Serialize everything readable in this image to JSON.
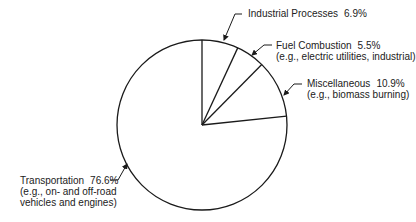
{
  "chart_data": {
    "type": "pie",
    "title": "",
    "start_angle_deg": 90,
    "direction": "clockwise",
    "slices": [
      {
        "name": "Industrial Processes",
        "sub": "",
        "value": 6.9,
        "label": "6.9%"
      },
      {
        "name": "Fuel Combustion",
        "sub": "(e.g., electric utilities, industrial)",
        "value": 5.5,
        "label": "5.5%"
      },
      {
        "name": "Miscellaneous",
        "sub": "(e.g., biomass burning)",
        "value": 10.9,
        "label": "10.9%"
      },
      {
        "name": "Transportation",
        "sub": "(e.g., on- and off-road vehicles and engines)",
        "value": 76.6,
        "label": "76.6%"
      }
    ],
    "colors": {
      "fill": "#ffffff",
      "stroke": "#1a1a1a"
    },
    "legend": "none (callout labels with leader arrows)"
  },
  "labels": {
    "industrial": {
      "name": "Industrial Processes",
      "pct": "6.9%"
    },
    "fuel": {
      "name": "Fuel Combustion",
      "pct": "5.5%",
      "sub": "(e.g., electric utilities, industrial)"
    },
    "misc": {
      "name": "Miscellaneous",
      "pct": "10.9%",
      "sub": "(e.g., biomass burning)"
    },
    "transport": {
      "name": "Transportation",
      "pct": "76.6%",
      "sub1": "(e.g., on- and off-road",
      "sub2": "vehicles and engines)"
    }
  }
}
